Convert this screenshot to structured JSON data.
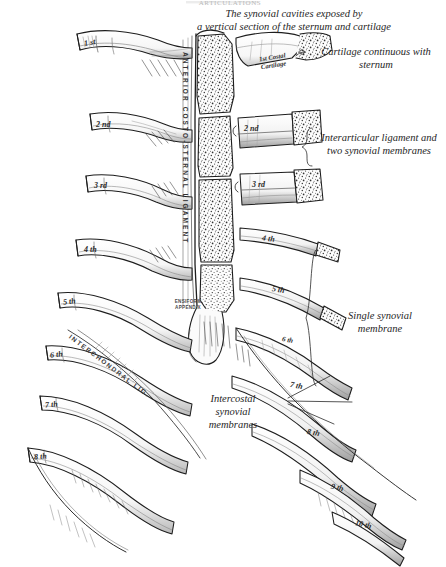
{
  "figure": {
    "faint_running_header": "ARTICULATIONS",
    "caption_top": "The synovial cavities exposed by\na vertical section of the sternum and cartilage",
    "background_color": "#ffffff",
    "ink_color": "#1a1a1a",
    "annotations": {
      "cartilage_continuous": "Cartilage continuous with\nsternum",
      "interarticular": "Interarticular ligament and\ntwo synovial membranes",
      "single_synovial": "Single synovial\nmembrane",
      "intercostal_synovial": "Intercostal\nsynovial\nmembranes",
      "ensiform": "ENSIFORM\nAPPENDIX",
      "vertical_ligament": "ANTERIOR COSTO-STERNAL LIGAMENT",
      "diagonal_ligament": "INTERCHONDRAL LIG.",
      "first_costal_cartilage": "1st Costal\nCartilage"
    },
    "ribs_left": [
      {
        "label": "1 st",
        "x": 84,
        "y": 40
      },
      {
        "label": "2 nd",
        "x": 94,
        "y": 121
      },
      {
        "label": "3 rd",
        "x": 92,
        "y": 183
      },
      {
        "label": "4 th",
        "x": 82,
        "y": 248
      },
      {
        "label": "5 th",
        "x": 62,
        "y": 302
      },
      {
        "label": "6 th",
        "x": 49,
        "y": 355
      },
      {
        "label": "7 th",
        "x": 44,
        "y": 406
      },
      {
        "label": "8 th",
        "x": 33,
        "y": 457
      }
    ],
    "ribs_right": [
      {
        "label": "2 nd",
        "x": 244,
        "y": 128
      },
      {
        "label": "3 rd",
        "x": 252,
        "y": 182
      },
      {
        "label": "4 th",
        "x": 262,
        "y": 238
      },
      {
        "label": "5 th",
        "x": 272,
        "y": 289
      },
      {
        "label": "6 th",
        "x": 283,
        "y": 339
      },
      {
        "label": "7 th",
        "x": 291,
        "y": 385
      },
      {
        "label": "8 th",
        "x": 307,
        "y": 432
      },
      {
        "label": "9 th",
        "x": 331,
        "y": 486
      },
      {
        "label": "10 th",
        "x": 355,
        "y": 523
      }
    ]
  }
}
